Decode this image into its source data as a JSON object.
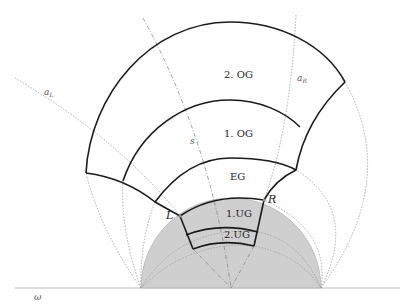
{
  "diagram": {
    "labels": {
      "og2": "2. OG",
      "og1": "1. OG",
      "eg": "EG",
      "ug1": "1.UG",
      "ug2": "2.UG",
      "point_left": "L",
      "point_right": "R",
      "curve_s": "s",
      "curve_aL": "a",
      "curve_aL_sub": "L",
      "curve_aR": "a",
      "curve_aR_sub": "R",
      "baseline": "ω"
    },
    "colors": {
      "ground_fill": "#cfcfcf",
      "outline": "#1a1a1a",
      "construction": "#9a9a9a"
    }
  }
}
